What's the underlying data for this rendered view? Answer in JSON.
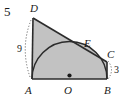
{
  "problem": {
    "number": "5"
  },
  "figure": {
    "type": "geometry-diagram",
    "colors": {
      "background": "#ffffff",
      "fill": "#c2c2c2",
      "stroke": "#2b2b2b",
      "dotted": "#6e6e6e",
      "text": "#1a1a1a"
    },
    "vertices": [
      {
        "name": "D",
        "label": "D",
        "x": 33,
        "y": 18,
        "label_x": 30,
        "label_y": 3
      },
      {
        "name": "A",
        "label": "A",
        "x": 32,
        "y": 79,
        "label_x": 25,
        "label_y": 85
      },
      {
        "name": "B",
        "label": "B",
        "x": 107,
        "y": 79,
        "label_x": 104,
        "label_y": 85
      },
      {
        "name": "C",
        "label": "C",
        "x": 107,
        "y": 62,
        "label_x": 107,
        "label_y": 49
      },
      {
        "name": "E",
        "label": "E",
        "x": 88,
        "y": 50,
        "label_x": 84,
        "label_y": 38
      },
      {
        "name": "O",
        "label": "O",
        "x": 69.5,
        "y": 79,
        "label_x": 64,
        "label_y": 85
      }
    ],
    "measurements": [
      {
        "name": "DA",
        "label": "9",
        "label_x": 17,
        "label_y": 44
      },
      {
        "name": "CB",
        "label": "3",
        "label_x": 114,
        "label_y": 65
      }
    ],
    "semicircle": {
      "center_x": 69.5,
      "center_y": 79,
      "radius": 37.5
    },
    "center_dot": {
      "x": 69.5,
      "y": 75.5,
      "r": 2.1
    }
  }
}
